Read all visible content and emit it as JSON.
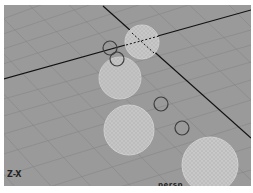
{
  "viewport": {
    "camera_name": "persp",
    "axis_indicator": "Z-X",
    "background_color": "#9a9a9a",
    "grid_color": "#858585",
    "axis_line_color": "#111111",
    "sphere_color": "#c9c9c9",
    "circle_color": "#444444"
  },
  "objects": {
    "spheres": [
      {
        "name": "sphere-1",
        "cx": 138,
        "cy": 37,
        "r": 17
      },
      {
        "name": "sphere-2",
        "cx": 116,
        "cy": 73,
        "r": 21
      },
      {
        "name": "sphere-3",
        "cx": 125,
        "cy": 125,
        "r": 25
      },
      {
        "name": "sphere-4",
        "cx": 206,
        "cy": 160,
        "r": 28
      }
    ],
    "circles": [
      {
        "name": "circle-1",
        "cx": 106,
        "cy": 43,
        "r": 7
      },
      {
        "name": "circle-2",
        "cx": 113,
        "cy": 54,
        "r": 7
      },
      {
        "name": "circle-3",
        "cx": 157,
        "cy": 99,
        "r": 7
      },
      {
        "name": "circle-4",
        "cx": 178,
        "cy": 123,
        "r": 7
      }
    ]
  }
}
